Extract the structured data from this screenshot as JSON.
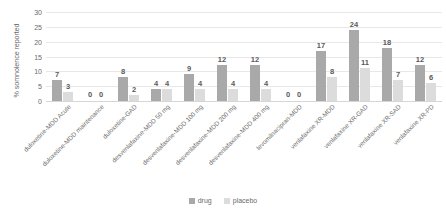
{
  "chart_data": {
    "type": "bar",
    "title": "",
    "xlabel": "",
    "ylabel": "% somnolence reported",
    "ylim": [
      0,
      30
    ],
    "yticks": [
      30,
      25,
      20,
      15,
      10,
      5,
      0
    ],
    "grid": true,
    "legend_position": "bottom",
    "categories": [
      "duloxetine-MDD Acute",
      "duloxetine-MDD maintenance",
      "duloxetine-GAD",
      "desvenlafaxine-MDD 50 mg",
      "desvenlafaxine-MDD 100 mg",
      "desvenlafaxine-MDD 200 mg",
      "desvenlafaxine-MDD 400 mg",
      "levomilnacipran-MDD",
      "venlafaxine XR-MDD",
      "venlafaxine XR-GAD",
      "venlafaxine XR-SAD",
      "venlafaxine XR-PD"
    ],
    "series": [
      {
        "name": "drug",
        "color": "#a9a9a9",
        "values": [
          7,
          0,
          8,
          4,
          9,
          12,
          12,
          0,
          17,
          24,
          18,
          12
        ]
      },
      {
        "name": "placebo",
        "color": "#dcdcdc",
        "values": [
          3,
          0,
          2,
          4,
          4,
          4,
          4,
          0,
          8,
          11,
          7,
          6
        ]
      }
    ]
  },
  "legend": {
    "items": [
      {
        "label": "drug",
        "color": "#a9a9a9"
      },
      {
        "label": "placebo",
        "color": "#dcdcdc"
      }
    ]
  }
}
